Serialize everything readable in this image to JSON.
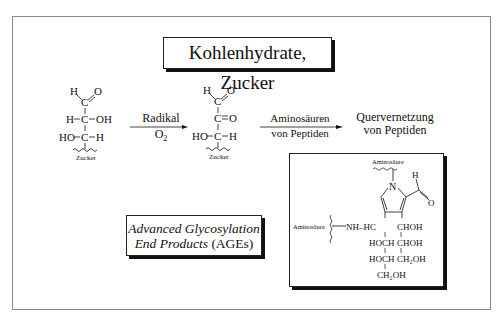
{
  "title": "Kohlenhydrate, Zucker",
  "molecule1": {
    "atoms": [
      "H",
      "C",
      "O",
      "H",
      "C",
      "OH",
      "HO",
      "C",
      "H"
    ],
    "label": "Zucker"
  },
  "arrow1": {
    "top": "Radikal",
    "bottom": "O",
    "bottom_sub": "2"
  },
  "molecule2": {
    "atoms": [
      "H",
      "C",
      "O",
      "C",
      "O",
      "HO",
      "C",
      "H"
    ],
    "label": "Zucker"
  },
  "arrow2": {
    "top": "Aminosäuren",
    "bottom": "von Peptiden"
  },
  "result": {
    "line1": "Quervernetzung",
    "line2": "von Peptiden"
  },
  "ages": {
    "line1": "Advanced Glycosylation",
    "line2_italic": "End Products",
    "line2_plain": " (AGEs)"
  },
  "product": {
    "top_label": "Aminosäure",
    "left_label": "Aminosäure",
    "n_atom": "N",
    "aldehyde_h": "H",
    "aldehyde_o": "O",
    "nh_hc": "NH–HC",
    "chain_left": [
      "HOCH",
      "HOCH",
      "CH₂OH"
    ],
    "chain_right": [
      "CHOH",
      "CHOH",
      "CH₂OH"
    ]
  }
}
